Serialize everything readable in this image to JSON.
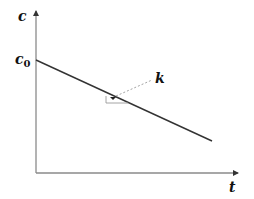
{
  "diagram": {
    "y_axis_label": "c",
    "x_axis_label": "t",
    "intercept_label": "c",
    "intercept_subscript": "0",
    "slope_label": "k",
    "colors": {
      "line": "#333333",
      "axis": "#8a8a8a",
      "leader": "#9a9a9a",
      "text": "#111111"
    }
  }
}
